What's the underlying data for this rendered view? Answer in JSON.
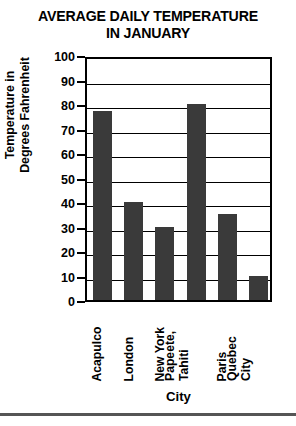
{
  "chart_data": {
    "type": "bar",
    "title": "AVERAGE DAILY TEMPERATURE IN JANUARY",
    "title_line1": "AVERAGE DAILY TEMPERATURE",
    "title_line2": "IN JANUARY",
    "xlabel": "City",
    "ylabel": "Temperature in Degrees Fahrenheit",
    "ylabel_line1": "Temperature in",
    "ylabel_line2": "Degrees Fahrenheit",
    "categories": [
      "Acapulco",
      "London",
      "New York",
      "Papeete, Tahiti",
      "Paris",
      "Quebec City"
    ],
    "category_lines": [
      [
        "Acapulco"
      ],
      [
        "London"
      ],
      [
        "New York"
      ],
      [
        "Papeete,",
        "Tahiti"
      ],
      [
        "Paris"
      ],
      [
        "Quebec",
        "City"
      ]
    ],
    "values": [
      77,
      40,
      30,
      80,
      35,
      10
    ],
    "ylim": [
      0,
      100
    ],
    "ytick_step": 10,
    "yticks": [
      100,
      90,
      80,
      70,
      60,
      50,
      40,
      30,
      20,
      10,
      0
    ],
    "grid": true,
    "grid_axis": "y",
    "legend": null,
    "bar_color": "#3a3a3a",
    "axis_color": "#000000",
    "background_color": "#ffffff"
  }
}
